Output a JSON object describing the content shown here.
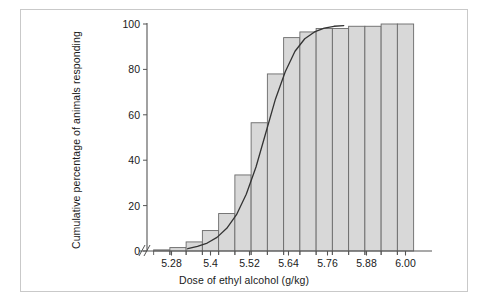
{
  "figure": {
    "frame_color": "#c9c9c9",
    "background": "#ffffff"
  },
  "chart_data": {
    "type": "bar",
    "title": "",
    "xlabel": "Dose of ethyl alcohol (g/kg)",
    "ylabel": "Cumulative percentage of animals responding",
    "xlim": [
      5.22,
      6.02
    ],
    "ylim": [
      0,
      100
    ],
    "grid": false,
    "legend": null,
    "axis_break": {
      "axis": "x",
      "symbol": "//",
      "note": "double slash break between origin and first category"
    },
    "bar_fill_color": "#d8d8d8",
    "bar_edge_color": "#6a6a6a",
    "curve_color": "#333333",
    "bin_width": 0.05,
    "categories": [
      "5.25",
      "5.30",
      "5.35",
      "5.40",
      "5.45",
      "5.50",
      "5.55",
      "5.60",
      "5.65",
      "5.70",
      "5.75",
      "5.80",
      "5.85",
      "5.90",
      "5.95",
      "6.00"
    ],
    "x": [
      5.25,
      5.3,
      5.35,
      5.4,
      5.45,
      5.5,
      5.55,
      5.6,
      5.65,
      5.7,
      5.75,
      5.8,
      5.85,
      5.9,
      5.95,
      6.0
    ],
    "values": [
      0.5,
      1.5,
      4.0,
      9.0,
      16.5,
      33.5,
      56.5,
      78.0,
      94.0,
      96.5,
      98.0,
      98.0,
      99.0,
      99.0,
      100.0,
      100.0
    ],
    "yticks": [
      0,
      20,
      40,
      60,
      80,
      100
    ],
    "ytick_labels": [
      "0",
      "20",
      "40",
      "60",
      "80",
      "100"
    ],
    "xticks": [
      5.28,
      5.4,
      5.52,
      5.64,
      5.76,
      5.88,
      6.0
    ],
    "xtick_labels": [
      "5.28",
      "5.4",
      "5.52",
      "5.64",
      "5.76",
      "5.88",
      "6.00"
    ],
    "fitted_curve": {
      "name": "cumulative logistic fit",
      "x": [
        5.33,
        5.36,
        5.39,
        5.42,
        5.45,
        5.48,
        5.51,
        5.54,
        5.57,
        5.6,
        5.63,
        5.66,
        5.69,
        5.72,
        5.75,
        5.78,
        5.81
      ],
      "y": [
        1.0,
        2.0,
        3.5,
        6.0,
        10.0,
        16.0,
        25.0,
        37.0,
        52.0,
        67.0,
        79.0,
        88.0,
        93.5,
        96.5,
        98.2,
        99.0,
        99.3
      ]
    }
  }
}
